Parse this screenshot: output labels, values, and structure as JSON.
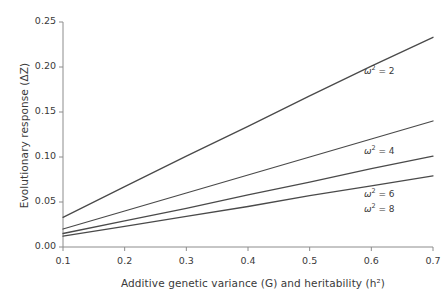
{
  "chart_data": {
    "type": "line",
    "title": "",
    "xlabel": "Additive genetic variance (G) and heritability (h²)",
    "ylabel": "Evolutionary response (ΔZ)",
    "xlim": [
      0.1,
      0.7
    ],
    "ylim": [
      0.0,
      0.25
    ],
    "xticks": [
      0.1,
      0.2,
      0.3,
      0.4,
      0.5,
      0.6,
      0.7
    ],
    "yticks": [
      0.0,
      0.05,
      0.1,
      0.15,
      0.2,
      0.25
    ],
    "xtick_labels": [
      "0.1",
      "0.2",
      "0.3",
      "0.4",
      "0.5",
      "0.6",
      "0.7"
    ],
    "ytick_labels": [
      "0.00",
      "0.05",
      "0.10",
      "0.15",
      "0.20",
      "0.25"
    ],
    "grid": false,
    "legend_position": "inline-right-of-curves",
    "x": [
      0.1,
      0.2,
      0.3,
      0.4,
      0.5,
      0.6,
      0.7
    ],
    "series": [
      {
        "name": "ω² = 2",
        "omega_squared": 2,
        "values": [
          0.033,
          0.067,
          0.101,
          0.134,
          0.168,
          0.201,
          0.233
        ],
        "label_x": 0.588,
        "label_y": 0.197
      },
      {
        "name": "ω² = 4",
        "omega_squared": 4,
        "values": [
          0.02,
          0.04,
          0.06,
          0.08,
          0.1,
          0.12,
          0.14
        ],
        "label_x": 0.588,
        "label_y": 0.108
      },
      {
        "name": "ω² = 6",
        "omega_squared": 6,
        "values": [
          0.015,
          0.029,
          0.043,
          0.058,
          0.072,
          0.087,
          0.101
        ],
        "label_x": 0.588,
        "label_y": 0.06
      },
      {
        "name": "ω² = 8",
        "omega_squared": 8,
        "values": [
          0.012,
          0.023,
          0.034,
          0.045,
          0.057,
          0.068,
          0.079
        ],
        "label_x": 0.588,
        "label_y": 0.043
      }
    ],
    "line_color": "#4a4a4a",
    "axis_color": "#8c8c8c",
    "text_color": "#3a3a3a",
    "background": "#ffffff"
  },
  "labels": {
    "omega_symbol": "ω",
    "sup2": "2",
    "eq2": "= 2",
    "eq4": "= 4",
    "eq6": "= 6",
    "eq8": "= 8"
  }
}
